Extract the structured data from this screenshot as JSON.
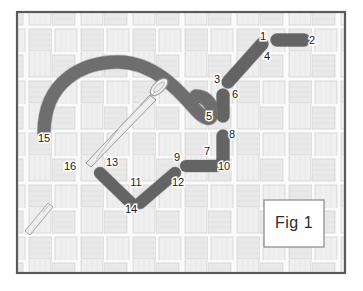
{
  "figure": {
    "caption": "Fig 1",
    "caption_box": {
      "x": 264,
      "y": 200,
      "w": 60,
      "h": 47
    },
    "frame": {
      "x": 17,
      "y": 12,
      "w": 328,
      "h": 261
    },
    "colors": {
      "background": "#ffffff",
      "frame_border": "#5a5a5a",
      "weave_band": "#e8e8e8",
      "weave_band_alt": "#efefef",
      "weave_line": "#cfcfcf",
      "weave_gap": "#fbfbfb",
      "thread_fill": "#6e6e6e",
      "thread_stroke": "#4d4d4d",
      "needle_fill": "#f2f2f2",
      "needle_stroke": "#9a9a9a",
      "label_text": "#1a1a1a",
      "caption_text": "#2b2b2b",
      "caption_box_fill": "#ffffff",
      "caption_box_border": "#888888"
    },
    "weave": {
      "type": "basket-weave",
      "period": 52,
      "band": 22,
      "gap": 4
    },
    "labels": [
      {
        "id": "1",
        "text": "1",
        "x": 263,
        "y": 37
      },
      {
        "id": "2",
        "text": "2",
        "x": 312,
        "y": 41
      },
      {
        "id": "3",
        "text": "3",
        "x": 217,
        "y": 80
      },
      {
        "id": "4",
        "text": "4",
        "x": 267,
        "y": 57
      },
      {
        "id": "5",
        "text": "5",
        "x": 209,
        "y": 117
      },
      {
        "id": "6",
        "text": "6",
        "x": 235,
        "y": 95
      },
      {
        "id": "7",
        "text": "7",
        "x": 207,
        "y": 152
      },
      {
        "id": "8",
        "text": "8",
        "x": 232,
        "y": 135
      },
      {
        "id": "9",
        "text": "9",
        "x": 177,
        "y": 158
      },
      {
        "id": "10",
        "text": "10",
        "x": 224,
        "y": 167
      },
      {
        "id": "11",
        "text": "11",
        "x": 136,
        "y": 183
      },
      {
        "id": "12",
        "text": "12",
        "x": 178,
        "y": 183
      },
      {
        "id": "13",
        "text": "13",
        "x": 112,
        "y": 163
      },
      {
        "id": "14",
        "text": "14",
        "x": 131,
        "y": 210
      },
      {
        "id": "15",
        "text": "15",
        "x": 44,
        "y": 139
      },
      {
        "id": "16",
        "text": "16",
        "x": 70,
        "y": 167
      }
    ],
    "thread_bars": [
      {
        "id": "bar-1-4",
        "x1": 228,
        "y1": 82,
        "x2": 262,
        "y2": 44,
        "w": 13,
        "refs": [
          "1",
          "4"
        ]
      },
      {
        "id": "bar-2",
        "x1": 277,
        "y1": 40,
        "x2": 304,
        "y2": 40,
        "w": 13,
        "refs": [
          "2"
        ]
      },
      {
        "id": "bar-3-5-6",
        "x1": 223,
        "y1": 95,
        "x2": 223,
        "y2": 116,
        "w": 13,
        "refs": [
          "3",
          "5",
          "6"
        ]
      },
      {
        "id": "bar-8-10",
        "x1": 223,
        "y1": 136,
        "x2": 223,
        "y2": 160,
        "w": 13,
        "refs": [
          "8",
          "10"
        ]
      },
      {
        "id": "bar-7-9",
        "x1": 186,
        "y1": 166,
        "x2": 217,
        "y2": 166,
        "w": 12,
        "refs": [
          "7",
          "9"
        ]
      },
      {
        "id": "bar-11-13",
        "x1": 100,
        "y1": 173,
        "x2": 131,
        "y2": 203,
        "w": 12,
        "refs": [
          "13",
          "11",
          "14"
        ]
      },
      {
        "id": "bar-12-14",
        "x1": 175,
        "y1": 173,
        "x2": 140,
        "y2": 203,
        "w": 12,
        "refs": [
          "12",
          "11",
          "14"
        ]
      }
    ],
    "thread_curve": {
      "id": "thread-sinuous-path",
      "refs": [
        "15"
      ],
      "width": 13,
      "path": "M 44 133 C 44 80, 84 62, 118 62 C 155 62, 180 92, 196 110 C 204 119, 212 122, 212 112 C 212 103, 205 96, 196 96"
    },
    "needles": [
      {
        "id": "needle-main",
        "refs": [
          "16"
        ],
        "tip_x": 86,
        "tip_y": 163,
        "eye_x": 159,
        "eye_y": 86
      },
      {
        "id": "needle-small",
        "refs": [],
        "tip_x": 25,
        "tip_y": 231,
        "eye_x": 51,
        "eye_y": 205
      }
    ]
  }
}
